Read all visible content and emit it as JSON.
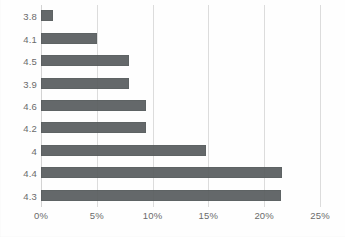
{
  "chart_data": {
    "type": "bar",
    "orientation": "horizontal",
    "title": "",
    "subtitle": "",
    "xlabel": "",
    "ylabel": "",
    "categories": [
      "3.8",
      "4.1",
      "4.5",
      "3.9",
      "4.6",
      "4.2",
      "4",
      "4.4",
      "4.3"
    ],
    "values": [
      1.1,
      5.0,
      7.9,
      7.9,
      9.4,
      9.4,
      14.8,
      21.6,
      21.5
    ],
    "value_unit": "%",
    "xlim": [
      0,
      25
    ],
    "xticks": [
      0,
      5,
      10,
      15,
      20,
      25
    ],
    "xtick_labels": [
      "0%",
      "5%",
      "10%",
      "15%",
      "20%",
      "25%"
    ],
    "grid": "vertical",
    "legend": null,
    "series": [
      {
        "name": "",
        "color": "#585c5e",
        "values": [
          1.1,
          5.0,
          7.9,
          7.9,
          9.4,
          9.4,
          14.8,
          21.6,
          21.5
        ]
      }
    ],
    "colors": {
      "bar": "#585c5e",
      "gridline": "#dcdcdc",
      "axis_text": "#6b6b6b",
      "background": "#fefefe"
    }
  }
}
